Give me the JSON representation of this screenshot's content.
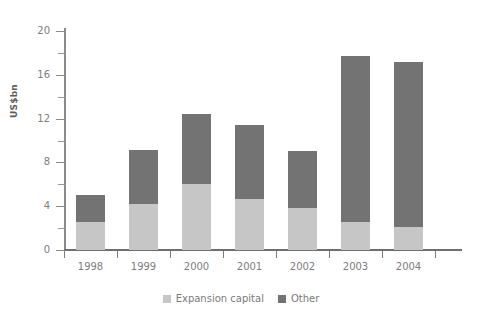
{
  "chart_data": {
    "type": "bar",
    "stacked": true,
    "title": "",
    "xlabel": "",
    "ylabel": "US$bn",
    "ylim": [
      0,
      20
    ],
    "yticks": [
      0,
      4,
      8,
      12,
      16,
      20
    ],
    "yticks_minor": [
      2,
      6,
      10,
      14,
      18
    ],
    "grid": false,
    "legend_position": "bottom",
    "categories": [
      "1998",
      "1999",
      "2000",
      "2001",
      "2002",
      "2003",
      "2004"
    ],
    "series": [
      {
        "name": "Expansion capital",
        "color": "#c6c6c6",
        "values": [
          2.6,
          4.2,
          6.0,
          4.7,
          3.8,
          2.6,
          2.1
        ]
      },
      {
        "name": "Other",
        "color": "#737373",
        "values": [
          2.4,
          4.9,
          6.4,
          6.7,
          5.2,
          15.1,
          15.1
        ]
      }
    ],
    "totals": [
      5.0,
      9.1,
      12.4,
      11.4,
      9.0,
      17.7,
      17.2
    ]
  },
  "axis": {
    "y_title": "US$bn",
    "y_tick_labels": [
      "20",
      "16",
      "12",
      "8",
      "4",
      "0"
    ],
    "x_tick_labels": [
      "1998",
      "1999",
      "2000",
      "2001",
      "2002",
      "2003",
      "2004"
    ]
  },
  "legend": {
    "items": [
      {
        "label": "Expansion capital",
        "color": "#c6c6c6"
      },
      {
        "label": "Other",
        "color": "#737373"
      }
    ]
  },
  "colors": {
    "expansion_capital": "#c6c6c6",
    "other": "#737373",
    "axis": "#8a8a8a",
    "text": "#7a7a7a",
    "background": "#ffffff"
  }
}
